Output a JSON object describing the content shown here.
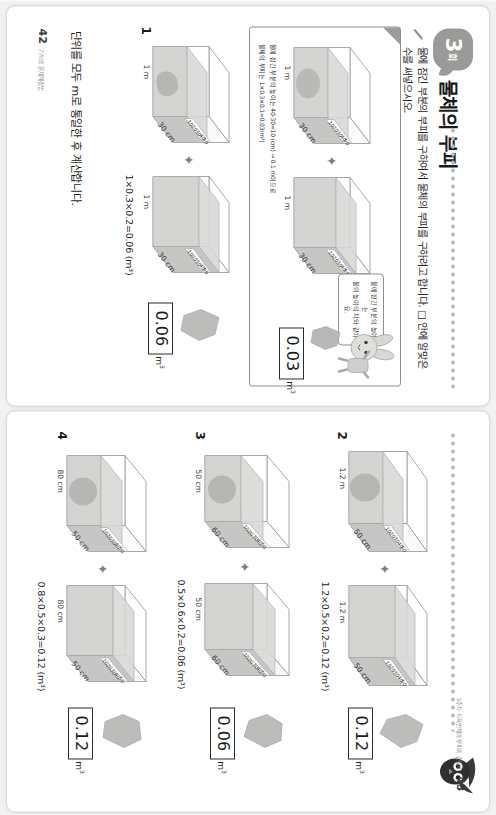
{
  "header": {
    "badge_number": "3",
    "badge_unit": "회",
    "title": "물체의 부피",
    "instruction": "물에 잠긴 부분의 부피를 구하여서 물체의 부피를 구하려고 합니다. □ 안에 알맞은 수를 써넣으시오."
  },
  "example": {
    "bubble_text": "물에 잠긴 부분의 높이는\n물의 높이의 차와 같아요.",
    "left_tank": {
      "width_label": "1 m",
      "depth_label": "30 cm",
      "ruler": [
        "50",
        "40",
        "30",
        "20",
        "10"
      ]
    },
    "right_tank": {
      "width_label": "1 m",
      "depth_label": "30 cm",
      "ruler": [
        "50",
        "40",
        "30",
        "20",
        "10"
      ]
    },
    "note_line1": "물에 잠긴 부분의 높이는 40-30=10 (cm) → 0.1 m이므로",
    "note_line2": "물체의 부피는 1×0.3×0.1=0.03(m³)",
    "answer_value": "0.03",
    "answer_unit": "m",
    "answer_exp": "3"
  },
  "problems": [
    {
      "number": "1",
      "left_tank": {
        "width_label": "1 m",
        "depth_label": "30 cm",
        "ruler": [
          "50",
          "40",
          "30",
          "20",
          "10"
        ]
      },
      "right_tank": {
        "width_label": "1 m",
        "depth_label": "30 cm",
        "ruler": [
          "50",
          "40",
          "30",
          "20",
          "10"
        ]
      },
      "equation": "1×0.3×0.2=0.06 (m³)",
      "answer_value": "0.06",
      "answer_unit": "m",
      "answer_exp": "3"
    },
    {
      "number": "2",
      "left_tank": {
        "width_label": "1.2 m",
        "depth_label": "50 cm",
        "ruler": [
          "50",
          "40",
          "30",
          "20",
          "10"
        ]
      },
      "right_tank": {
        "width_label": "1.2 m",
        "depth_label": "50 cm",
        "ruler": [
          "50",
          "40",
          "30",
          "20",
          "10"
        ]
      },
      "equation": "1.2×0.5×0.2=0.12 (m³)",
      "answer_value": "0.12",
      "answer_unit": "m",
      "answer_exp": "3"
    },
    {
      "number": "3",
      "left_tank": {
        "width_label": "50 cm",
        "depth_label": "60 cm",
        "ruler": [
          "50",
          "40",
          "30",
          "20",
          "10"
        ]
      },
      "right_tank": {
        "width_label": "50 cm",
        "depth_label": "60 cm",
        "ruler": [
          "50",
          "40",
          "30",
          "20",
          "10"
        ]
      },
      "equation": "0.5×0.6×0.2=0.06 (m³)",
      "answer_value": "0.06",
      "answer_unit": "m",
      "answer_exp": "3"
    },
    {
      "number": "4",
      "left_tank": {
        "width_label": "80 cm",
        "depth_label": "50 cm",
        "ruler": [
          "50",
          "40",
          "30",
          "20",
          "10"
        ]
      },
      "right_tank": {
        "width_label": "80 cm",
        "depth_label": "50 cm",
        "ruler": [
          "50",
          "40",
          "30",
          "20",
          "10"
        ]
      },
      "equation": "0.8×0.5×0.3=0.12 (m³)",
      "answer_value": "0.12",
      "answer_unit": "m",
      "answer_exp": "3"
    }
  ],
  "footer_note": "단위를 모두 m로 통일한 후 계산합니다.",
  "folio_left": {
    "number": "42",
    "text": "기적의 문제해결법"
  },
  "folio_right": {
    "number": "43",
    "text": "3주차 직육면체의 부피와 겉넓이"
  },
  "colors": {
    "accent_gray": "#9a9a98",
    "water_fill": "#c9c9c7",
    "glass_stroke": "#9d9d9b",
    "rock_fill": "#b6b6b4",
    "ink": "#1b1b1b"
  }
}
